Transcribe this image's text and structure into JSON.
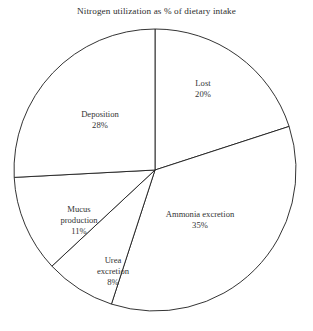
{
  "chart_data": {
    "type": "pie",
    "title": "Nitrogen utilization as % of dietary intake",
    "xlabel": "",
    "ylabel": "",
    "unit": "%",
    "legend_position": "none",
    "grid": false,
    "labels_inside_slices": true,
    "start_angle_deg": 0,
    "direction": "clockwise",
    "categories": [
      "Lost",
      "Ammonia excretion",
      "Urea excretion",
      "Mucus production",
      "Deposition"
    ],
    "values": [
      20,
      35,
      8,
      11,
      28
    ],
    "slices": [
      {
        "name": "Lost",
        "label_lines": [
          "Lost"
        ],
        "value": 20,
        "value_label": "20%",
        "start_angle_deg": 0,
        "end_angle_deg": 72,
        "fill": "#ffffff",
        "stroke": "#1d1d1d"
      },
      {
        "name": "Ammonia excretion",
        "label_lines": [
          "Ammonia excretion"
        ],
        "value": 35,
        "value_label": "35%",
        "start_angle_deg": 72,
        "end_angle_deg": 198,
        "fill": "#ffffff",
        "stroke": "#1d1d1d"
      },
      {
        "name": "Urea excretion",
        "label_lines": [
          "Urea",
          "excretion"
        ],
        "value": 8,
        "value_label": "8%",
        "start_angle_deg": 198,
        "end_angle_deg": 227,
        "fill": "#ffffff",
        "stroke": "#1d1d1d"
      },
      {
        "name": "Mucus production",
        "label_lines": [
          "Mucus",
          "production"
        ],
        "value": 11,
        "value_label": "11%",
        "start_angle_deg": 227,
        "end_angle_deg": 267,
        "fill": "#ffffff",
        "stroke": "#1d1d1d"
      },
      {
        "name": "Deposition",
        "label_lines": [
          "Deposition"
        ],
        "value": 28,
        "value_label": "28%",
        "start_angle_deg": 267,
        "end_angle_deg": 360,
        "fill": "#ffffff",
        "stroke": "#1d1d1d"
      }
    ]
  },
  "labels": {
    "lost": {
      "name": "Lost",
      "pct": "20%"
    },
    "ammonia": {
      "name": "Ammonia excretion",
      "pct": "35%"
    },
    "urea": {
      "line1": "Urea",
      "line2": "excretion",
      "pct": "8%"
    },
    "mucus": {
      "line1": "Mucus",
      "line2": "production",
      "pct": "11%"
    },
    "deposition": {
      "name": "Deposition",
      "pct": "28%"
    }
  },
  "geometry": {
    "center_x": 155,
    "center_y": 170,
    "radius": 141
  },
  "colors": {
    "background": "#ffffff",
    "stroke": "#1d1d1d",
    "text": "#333333",
    "title_text": "#2e2e2e"
  }
}
